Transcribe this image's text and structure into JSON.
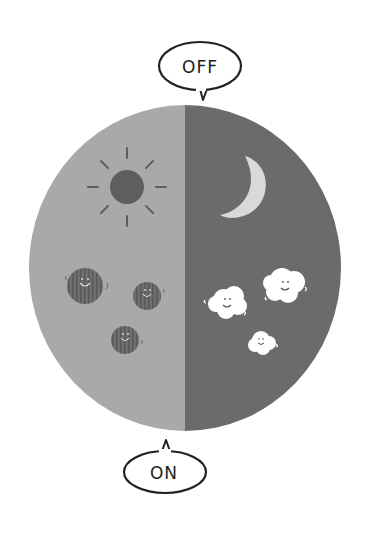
{
  "diagram": {
    "labels": {
      "top": "OFF",
      "bottom": "ON"
    },
    "halves": {
      "left": {
        "theme": "day",
        "icon": "sun-icon",
        "particles": "dark-dust-balls",
        "particle_count": 3
      },
      "right": {
        "theme": "night",
        "icon": "moon-icon",
        "particles": "white-fluffy-clouds",
        "particle_count": 3
      }
    },
    "colors": {
      "day_bg": "#a9a9a9",
      "night_bg": "#6b6b6b",
      "sun": "#5e5e5e",
      "moon": "#d9d9d9",
      "dust": "#6a6a6a",
      "cloud": "#ffffff",
      "outline": "#222222"
    }
  }
}
